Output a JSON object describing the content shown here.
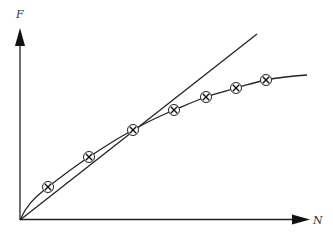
{
  "diagram": {
    "y_axis": {
      "label": "F"
    },
    "x_axis": {
      "label": "N"
    },
    "colors": {
      "stroke": "#222222",
      "background": "#ffffff"
    },
    "markers": [
      {
        "x": 48,
        "y": 187
      },
      {
        "x": 89,
        "y": 157
      },
      {
        "x": 133,
        "y": 130
      },
      {
        "x": 174,
        "y": 110
      },
      {
        "x": 206,
        "y": 97
      },
      {
        "x": 236,
        "y": 88
      },
      {
        "x": 266,
        "y": 80
      }
    ],
    "marker_style": "circled-x"
  },
  "chart_data": {
    "type": "line",
    "title": "",
    "xlabel": "N",
    "ylabel": "F",
    "grid": false,
    "series": [
      {
        "name": "measured points (circled x)",
        "x": [
          1,
          2,
          3,
          4,
          5,
          6,
          7
        ],
        "values": [
          1.0,
          2.0,
          2.9,
          3.6,
          4.0,
          4.3,
          4.6
        ]
      },
      {
        "name": "linear tangent",
        "x": [
          0,
          8
        ],
        "values": [
          0,
          6.2
        ]
      },
      {
        "name": "fitted curve",
        "x": [
          0,
          8.5
        ],
        "values": [
          0,
          4.9
        ]
      }
    ]
  }
}
